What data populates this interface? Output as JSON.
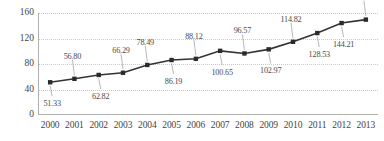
{
  "chart_data": {
    "type": "line",
    "title": "",
    "subtitle": "",
    "xlabel": "",
    "ylabel": "",
    "categories": [
      "2000",
      "2001",
      "2002",
      "2003",
      "2004",
      "2005",
      "2006",
      "2007",
      "2008",
      "2009",
      "2010",
      "2011",
      "2012",
      "2013"
    ],
    "values": [
      51.33,
      56.8,
      62.82,
      66.29,
      78.49,
      86.19,
      88.12,
      100.65,
      96.57,
      102.97,
      114.82,
      128.53,
      144.21,
      149.61
    ],
    "point_labels": [
      "51.33",
      "56.80",
      "62.82",
      "66.29",
      "78.49",
      "86.19",
      "88.12",
      "100.65",
      "96.57",
      "102.97",
      "114.82",
      "128.53",
      "144.21",
      "149.61"
    ],
    "label_positions": [
      "below",
      "above",
      "below",
      "above",
      "above",
      "below",
      "above",
      "below",
      "above",
      "below",
      "above",
      "below",
      "below",
      "above"
    ],
    "ylim": [
      0,
      160
    ],
    "yticks": [
      0,
      40,
      80,
      120,
      160
    ],
    "ytick_labels": [
      "0",
      "40",
      "80",
      "120",
      "160"
    ],
    "grid": true,
    "grid_axis": "y",
    "legend": false,
    "series": [
      {
        "name": "series-1",
        "color": "#333333",
        "marker": "square",
        "values": [
          51.33,
          56.8,
          62.82,
          66.29,
          78.49,
          86.19,
          88.12,
          100.65,
          96.57,
          102.97,
          114.82,
          128.53,
          144.21,
          149.61
        ]
      }
    ],
    "colors": {
      "line": "#333333",
      "marker": "#2b2b2b",
      "grid": "#c8c8c8",
      "axis": "#b0b0b0",
      "text": "#444444",
      "label_text": "#4a4a4a",
      "background": "#ffffff"
    }
  }
}
